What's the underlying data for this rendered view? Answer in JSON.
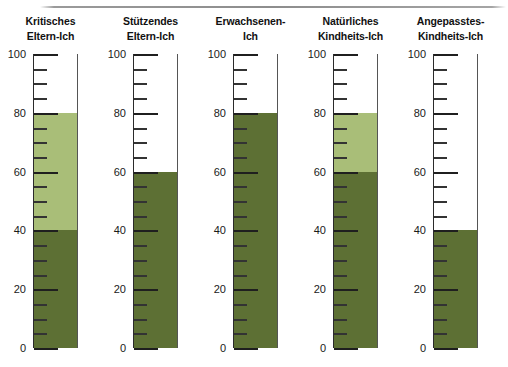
{
  "chart_data": {
    "type": "bar",
    "title": "",
    "xlabel": "",
    "ylabel": "",
    "ylim": [
      0,
      100
    ],
    "grid": false,
    "legend": "none",
    "orientation": "vertical",
    "tick_interval_minor": 5,
    "tick_interval_major": 20,
    "tick_labels": [
      "0",
      "20",
      "40",
      "60",
      "80",
      "100"
    ],
    "colors": {
      "dark_green": "#5d7034",
      "light_green": "#a9be78",
      "axis": "#2b2b2b",
      "tube_border": "#555555",
      "text": "#111111",
      "rule": "#8d8d8d",
      "background": "#ffffff"
    },
    "categories": [
      "Kritisches Eltern-Ich",
      "Stützendes Eltern-Ich",
      "Erwachsenen-Ich",
      "Natürliches Kindheits-Ich",
      "Angepasstes-Kindheits-Ich"
    ],
    "series": [
      {
        "name": "dark",
        "values": [
          40,
          60,
          80,
          60,
          40
        ]
      },
      {
        "name": "light",
        "values": [
          80,
          60,
          80,
          80,
          40
        ]
      }
    ],
    "values": [
      40,
      60,
      80,
      60,
      40
    ]
  },
  "columns": [
    {
      "header_line1": "Kritisches",
      "header_line2": "Eltern-Ich",
      "dark_value": 40,
      "light_value": 80,
      "has_light_band": true
    },
    {
      "header_line1": "Stützendes",
      "header_line2": "Eltern-Ich",
      "dark_value": 60,
      "light_value": 60,
      "has_light_band": false
    },
    {
      "header_line1": "Erwachsenen-",
      "header_line2": "Ich",
      "dark_value": 80,
      "light_value": 80,
      "has_light_band": false
    },
    {
      "header_line1": "Natürliches",
      "header_line2": "Kindheits-Ich",
      "dark_value": 60,
      "light_value": 80,
      "has_light_band": true
    },
    {
      "header_line1": "Angepasstes-",
      "header_line2": "Kindheits-Ich",
      "dark_value": 40,
      "light_value": 40,
      "has_light_band": false
    }
  ],
  "axis": {
    "min": 0,
    "max": 100,
    "labels": [
      100,
      80,
      60,
      40,
      20,
      0
    ]
  }
}
